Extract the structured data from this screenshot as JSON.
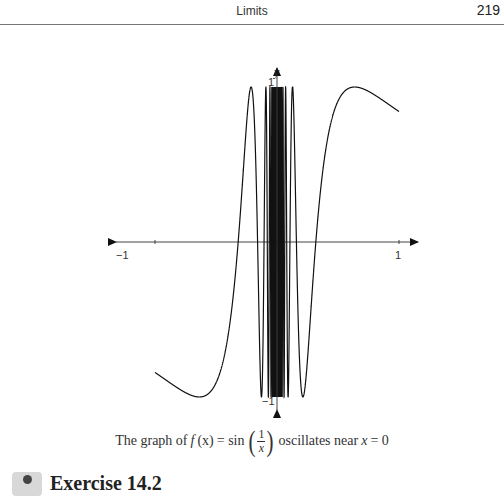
{
  "header": {
    "title": "Limits",
    "page_number": "219"
  },
  "figure": {
    "axis_labels": {
      "y": "y",
      "x_min": "−1",
      "x_max": "1",
      "y_max": "1",
      "y_min": "−1"
    },
    "caption": {
      "prefix": "The graph of",
      "func": "f",
      "arg": "(x)",
      "equals": "= sin",
      "num": "1",
      "den": "x",
      "suffix": "oscillates near",
      "var": "x",
      "tail": "= 0"
    }
  },
  "exercise": {
    "title": "Exercise 14.2"
  },
  "chart_data": {
    "type": "line",
    "title": "",
    "function": "sin(1/x)",
    "xlabel": "",
    "ylabel": "y",
    "xlim": [
      -1.05,
      1.2
    ],
    "ylim": [
      -1.1,
      1.1
    ],
    "x_ticks": [
      -1,
      1
    ],
    "y_ticks": [
      -1,
      1
    ],
    "grid": false,
    "series": [
      {
        "name": "f(x) = sin(1/x)",
        "domain": [
          -1,
          1.0
        ]
      }
    ],
    "pixel_map": {
      "origin_x": 277,
      "origin_y": 242,
      "px_per_x": 122,
      "px_per_y": 155
    }
  }
}
